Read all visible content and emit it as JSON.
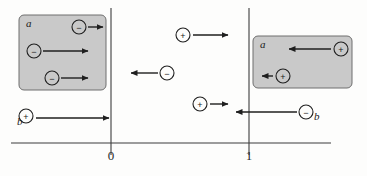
{
  "figure": {
    "background_color": "#fdfdfc",
    "line_color": "#3c3c3c",
    "box_fill_color": "#c9c9c9",
    "box_stroke_color": "#6e6e6e"
  },
  "axis": {
    "name": "position-axis",
    "y": 143,
    "x_start": 11,
    "x_end": 331,
    "ticks": [
      {
        "label": "0",
        "x": 111,
        "label_x": 111,
        "label_y": 160
      },
      {
        "label": "1",
        "x": 249,
        "label_x": 249,
        "label_y": 160
      }
    ],
    "verticals": [
      {
        "name": "boundary-line-0",
        "x": 111,
        "y_top": 8,
        "y_bottom": 155
      },
      {
        "name": "boundary-line-1",
        "x": 249,
        "y_top": 8,
        "y_bottom": 155
      }
    ]
  },
  "regions": [
    {
      "name": "left-region-box",
      "label": "a",
      "x": 19,
      "y": 15,
      "width": 87,
      "height": 75,
      "label_x": 26,
      "label_y": 27
    },
    {
      "name": "right-region-box",
      "label": "a",
      "x": 253,
      "y": 36,
      "width": 99,
      "height": 52,
      "label_x": 260,
      "label_y": 48
    }
  ],
  "carriers": [
    {
      "name": "electron-left-box-top",
      "sign": "−",
      "charge": "negative",
      "cx": 79,
      "cy": 27,
      "r": 7,
      "arrow_from_x": 88,
      "arrow_to_x": 103,
      "arrow_y": 27,
      "direction": "right",
      "label": "",
      "label_x": 0,
      "label_y": 0
    },
    {
      "name": "electron-left-box-middle",
      "sign": "−",
      "charge": "negative",
      "cx": 34,
      "cy": 51,
      "r": 7,
      "arrow_from_x": 43,
      "arrow_to_x": 88,
      "arrow_y": 51,
      "direction": "right",
      "label": "",
      "label_x": 0,
      "label_y": 0
    },
    {
      "name": "electron-left-box-bottom",
      "sign": "−",
      "charge": "negative",
      "cx": 52,
      "cy": 78,
      "r": 7,
      "arrow_from_x": 61,
      "arrow_to_x": 88,
      "arrow_y": 78,
      "direction": "right",
      "label": "",
      "label_x": 0,
      "label_y": 0
    },
    {
      "name": "hole-b-left",
      "sign": "+",
      "charge": "positive",
      "cx": 26,
      "cy": 116,
      "r": 7,
      "arrow_from_x": 36,
      "arrow_to_x": 109,
      "arrow_y": 118,
      "direction": "right",
      "label": "b",
      "label_x": 17,
      "label_y": 125
    },
    {
      "name": "hole-middle-upper",
      "sign": "+",
      "charge": "positive",
      "cx": 183,
      "cy": 35,
      "r": 7,
      "arrow_from_x": 193,
      "arrow_to_x": 228,
      "arrow_y": 35,
      "direction": "right",
      "label": "",
      "label_x": 0,
      "label_y": 0
    },
    {
      "name": "electron-middle",
      "sign": "−",
      "charge": "negative",
      "cx": 167,
      "cy": 73,
      "r": 7,
      "arrow_from_x": 158,
      "arrow_to_x": 131,
      "arrow_y": 73,
      "direction": "left",
      "label": "",
      "label_x": 0,
      "label_y": 0
    },
    {
      "name": "hole-middle-lower",
      "sign": "+",
      "charge": "positive",
      "cx": 200,
      "cy": 104,
      "r": 7,
      "arrow_from_x": 210,
      "arrow_to_x": 228,
      "arrow_y": 104,
      "direction": "right",
      "label": "",
      "label_x": 0,
      "label_y": 0
    },
    {
      "name": "hole-right-box-top",
      "sign": "+",
      "charge": "positive",
      "cx": 341,
      "cy": 49,
      "r": 7,
      "arrow_from_x": 331,
      "arrow_to_x": 289,
      "arrow_y": 49,
      "direction": "left",
      "label": "",
      "label_x": 0,
      "label_y": 0
    },
    {
      "name": "hole-right-box-bottom",
      "sign": "+",
      "charge": "positive",
      "cx": 283,
      "cy": 76,
      "r": 7,
      "arrow_from_x": 273,
      "arrow_to_x": 262,
      "arrow_y": 76,
      "direction": "left",
      "label": "",
      "label_x": 0,
      "label_y": 0
    },
    {
      "name": "electron-b-right",
      "sign": "−",
      "charge": "negative",
      "cx": 306,
      "cy": 112,
      "r": 7,
      "arrow_from_x": 297,
      "arrow_to_x": 236,
      "arrow_y": 112,
      "direction": "left",
      "label": "b",
      "label_x": 314,
      "label_y": 120
    }
  ]
}
